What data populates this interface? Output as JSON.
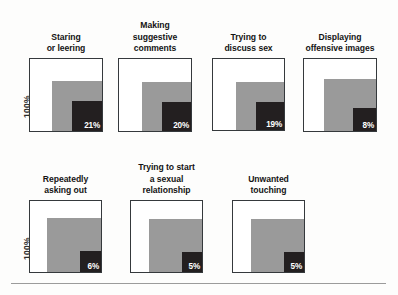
{
  "chart_data": {
    "type": "bar",
    "title": "",
    "subtitle": "",
    "xlabel": "",
    "ylabel": "100%",
    "ylim": [
      0,
      100
    ],
    "grid": false,
    "legend_position": "none",
    "note": "Each panel is a nested-square (area) chart: the white outer square represents 100%, a gray mid square, and a dark inner square labeled with the percentage value.",
    "categories": [
      "Staring or leering",
      "Making suggestive comments",
      "Trying to discuss sex",
      "Displaying offensive images",
      "Repeatedly asking out",
      "Trying to start a sexual relationship",
      "Unwanted touching"
    ],
    "values": [
      21,
      20,
      19,
      8,
      6,
      5,
      5
    ],
    "value_labels": [
      "21%",
      "20%",
      "19%",
      "8%",
      "6%",
      "5%",
      "5%"
    ],
    "axis_max_label": "100%"
  },
  "colors": {
    "outer_square_fill": "#ffffff",
    "outer_square_border": "#35393c",
    "mid_square": "#9a9a9a",
    "value_square": "#231f20",
    "value_text": "#ffffff",
    "title_text": "#141414",
    "background": "#fdfdfc",
    "rule": "#9b9b9b"
  },
  "axis": {
    "row0_label": "100%",
    "row1_label": "100%"
  },
  "rows": [
    {
      "name": "row-top",
      "panels": [
        {
          "id": "staring-or-leering",
          "title": "Staring\nor leering",
          "value": 21,
          "value_label": "21%",
          "left": 29,
          "outer_top": 58,
          "outer_size": 74,
          "mid_size": 50,
          "val_size": 30
        },
        {
          "id": "making-suggestive-comments",
          "title": "Making\nsuggestive\ncomments",
          "value": 20,
          "value_label": "20%",
          "left": 118,
          "outer_top": 58,
          "outer_size": 74,
          "mid_size": 49,
          "val_size": 29
        },
        {
          "id": "trying-to-discuss-sex",
          "title": "Trying to\ndiscuss sex",
          "value": 19,
          "value_label": "19%",
          "left": 212,
          "outer_top": 58,
          "outer_size": 73,
          "mid_size": 48,
          "val_size": 28
        },
        {
          "id": "displaying-offensive-images",
          "title": "Displaying\noffensive images",
          "value": 8,
          "value_label": "8%",
          "left": 303,
          "outer_top": 58,
          "outer_size": 74,
          "mid_size": 52,
          "val_size": 23
        }
      ]
    },
    {
      "name": "row-bottom",
      "panels": [
        {
          "id": "repeatedly-asking-out",
          "title": "Repeatedly\nasking out",
          "value": 6,
          "value_label": "6%",
          "left": 29,
          "outer_top": 50,
          "outer_size": 73,
          "mid_size": 54,
          "val_size": 21
        },
        {
          "id": "trying-to-start-a-sexual-relationship",
          "title": "Trying to start\na sexual\nrelationship",
          "value": 5,
          "value_label": "5%",
          "left": 130,
          "outer_top": 50,
          "outer_size": 73,
          "mid_size": 53,
          "val_size": 20
        },
        {
          "id": "unwanted-touching",
          "title": "Unwanted\ntouching",
          "value": 5,
          "value_label": "5%",
          "left": 232,
          "outer_top": 50,
          "outer_size": 73,
          "mid_size": 53,
          "val_size": 20
        }
      ]
    }
  ]
}
